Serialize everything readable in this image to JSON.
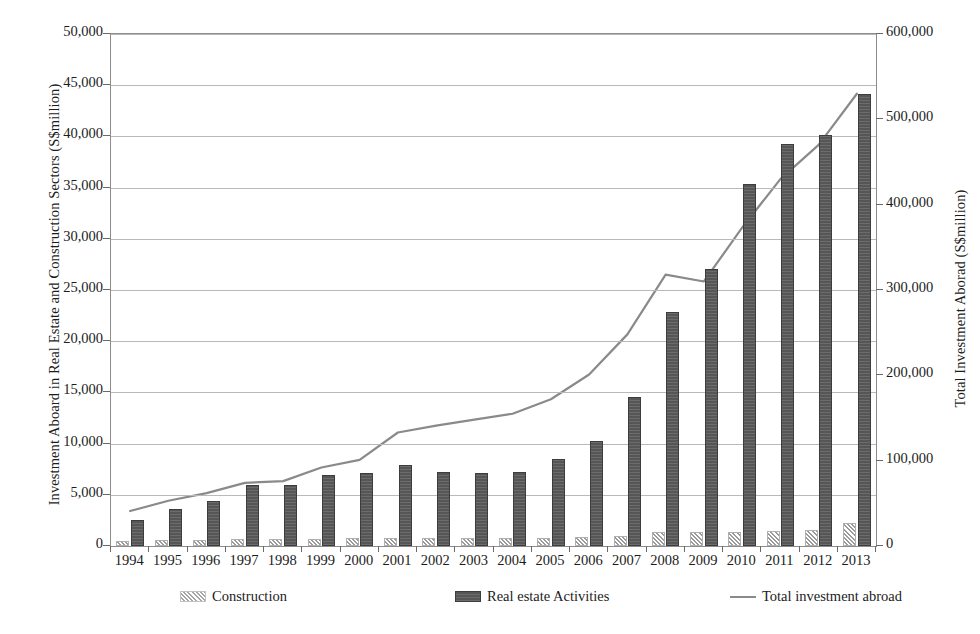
{
  "chart_data": {
    "type": "bar",
    "title": "",
    "subtitle": "",
    "xlabel": "",
    "ylabel": "Investment Aboard in Real Estate and Construction Sectors (S$million)",
    "y2label": "Total Investment Aborad (S$million)",
    "categories": [
      "1994",
      "1995",
      "1996",
      "1997",
      "1998",
      "1999",
      "2000",
      "2001",
      "2002",
      "2003",
      "2004",
      "2005",
      "2006",
      "2007",
      "2008",
      "2009",
      "2010",
      "2011",
      "2012",
      "2013"
    ],
    "ylim": [
      0,
      50000
    ],
    "yticks": [
      0,
      5000,
      10000,
      15000,
      20000,
      25000,
      30000,
      35000,
      40000,
      45000,
      50000
    ],
    "ytick_labels": [
      "0",
      "5,000",
      "10,000",
      "15,000",
      "20,000",
      "25,000",
      "30,000",
      "35,000",
      "40,000",
      "45,000",
      "50,000"
    ],
    "y2lim": [
      0,
      600000
    ],
    "y2ticks": [
      0,
      100000,
      200000,
      300000,
      400000,
      500000,
      600000
    ],
    "y2tick_labels": [
      "0",
      "100,000",
      "200,000",
      "300,000",
      "400,000",
      "500,000",
      "600,000"
    ],
    "grid": true,
    "legend_position": "bottom",
    "series": [
      {
        "name": "Construction",
        "type": "bar",
        "axis": "left",
        "color": "#e2e2e2",
        "pattern": "diagonal-hatch",
        "values": [
          500,
          550,
          600,
          650,
          700,
          700,
          750,
          800,
          800,
          750,
          750,
          800,
          900,
          1000,
          1400,
          1400,
          1400,
          1500,
          1600,
          2200
        ]
      },
      {
        "name": "Real estate Activities",
        "type": "bar",
        "axis": "left",
        "color": "#565656",
        "values": [
          2500,
          3600,
          4400,
          6000,
          5950,
          6900,
          7100,
          7900,
          7200,
          7100,
          7200,
          8500,
          10300,
          14600,
          22900,
          27100,
          35400,
          39300,
          40100,
          44100
        ]
      },
      {
        "name": "Total  investment abroad",
        "type": "line",
        "axis": "right",
        "color": "#8a8a8a",
        "values": [
          41000,
          53000,
          62000,
          74000,
          76000,
          92000,
          101000,
          133000,
          141000,
          148000,
          155000,
          172000,
          201000,
          248000,
          318000,
          310000,
          373000,
          430000,
          470000,
          530000
        ]
      }
    ]
  },
  "legend": {
    "items": [
      {
        "label": "Construction",
        "swatch": "hatch-swatch"
      },
      {
        "label": "Real estate Activities",
        "swatch": "dark-bar-swatch"
      },
      {
        "label": "Total  investment abroad",
        "swatch": "line-swatch"
      }
    ]
  }
}
